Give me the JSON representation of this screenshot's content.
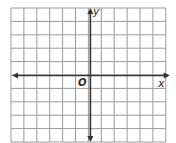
{
  "diagram": {
    "type": "coordinate-plane",
    "grid": {
      "columns": 12,
      "rows": 10,
      "left": 11,
      "top": 8,
      "cell_width": 12.9,
      "cell_height": 13.4,
      "line_color": "#9a9a9a"
    },
    "axes": {
      "color": "#333333",
      "x_axis_row": 5,
      "y_axis_col": 6,
      "x_label": "x",
      "y_label": "y",
      "origin_label": "O",
      "x_arrows": [
        "left",
        "right"
      ],
      "y_arrows": [
        "up",
        "down"
      ]
    }
  }
}
